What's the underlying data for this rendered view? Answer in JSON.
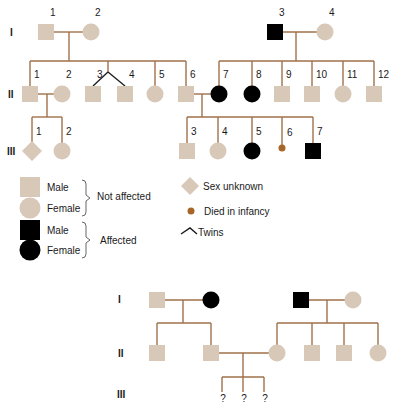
{
  "colors": {
    "line": "#a0714a",
    "unaffected": "#d8c8b8",
    "affected": "#000000",
    "infant_death": "#a8652a",
    "twins_line": "#1a1a1a",
    "text": "#1a1a1a"
  },
  "pedigree_top": {
    "generation_labels": [
      {
        "label": "I",
        "x": 10,
        "y": 36
      },
      {
        "label": "II",
        "x": 8,
        "y": 98
      },
      {
        "label": "III",
        "x": 7,
        "y": 155
      }
    ],
    "individuals": [
      {
        "id": "I-1",
        "num": "1",
        "shape": "square",
        "status": "unaffected",
        "x": 46,
        "y": 32
      },
      {
        "id": "I-2",
        "num": "2",
        "shape": "circle",
        "status": "unaffected",
        "x": 91,
        "y": 32
      },
      {
        "id": "I-3",
        "num": "3",
        "shape": "square",
        "status": "affected",
        "x": 275,
        "y": 32
      },
      {
        "id": "I-4",
        "num": "4",
        "shape": "circle",
        "status": "unaffected",
        "x": 325,
        "y": 32
      },
      {
        "id": "II-1",
        "num": "1",
        "shape": "square",
        "status": "unaffected",
        "x": 30,
        "y": 94
      },
      {
        "id": "II-2",
        "num": "2",
        "shape": "circle",
        "status": "unaffected",
        "x": 62,
        "y": 94
      },
      {
        "id": "II-3",
        "num": "3",
        "shape": "square",
        "status": "unaffected",
        "x": 93,
        "y": 94
      },
      {
        "id": "II-4",
        "num": "4",
        "shape": "square",
        "status": "unaffected",
        "x": 125,
        "y": 94
      },
      {
        "id": "II-5",
        "num": "5",
        "shape": "circle",
        "status": "unaffected",
        "x": 155,
        "y": 94
      },
      {
        "id": "II-6",
        "num": "6",
        "shape": "square",
        "status": "unaffected",
        "x": 186,
        "y": 94
      },
      {
        "id": "II-7",
        "num": "7",
        "shape": "circle",
        "status": "affected",
        "x": 219,
        "y": 94
      },
      {
        "id": "II-8",
        "num": "8",
        "shape": "circle",
        "status": "affected",
        "x": 252,
        "y": 94
      },
      {
        "id": "II-9",
        "num": "9",
        "shape": "square",
        "status": "unaffected",
        "x": 282,
        "y": 94
      },
      {
        "id": "II-10",
        "num": "10",
        "shape": "square",
        "status": "unaffected",
        "x": 312,
        "y": 94
      },
      {
        "id": "II-11",
        "num": "11",
        "shape": "circle",
        "status": "unaffected",
        "x": 343,
        "y": 94
      },
      {
        "id": "II-12",
        "num": "12",
        "shape": "square",
        "status": "unaffected",
        "x": 374,
        "y": 94
      },
      {
        "id": "III-1",
        "num": "1",
        "shape": "diamond",
        "status": "unaffected",
        "x": 32,
        "y": 151
      },
      {
        "id": "III-2",
        "num": "2",
        "shape": "circle",
        "status": "unaffected",
        "x": 62,
        "y": 151
      },
      {
        "id": "III-3",
        "num": "3",
        "shape": "square",
        "status": "unaffected",
        "x": 187,
        "y": 151
      },
      {
        "id": "III-4",
        "num": "4",
        "shape": "circle",
        "status": "unaffected",
        "x": 218,
        "y": 151
      },
      {
        "id": "III-5",
        "num": "5",
        "shape": "circle",
        "status": "affected",
        "x": 252,
        "y": 151
      },
      {
        "id": "III-6",
        "num": "6",
        "shape": "dot",
        "status": "died_in_infancy",
        "x": 282,
        "y": 148
      },
      {
        "id": "III-7",
        "num": "7",
        "shape": "square",
        "status": "affected",
        "x": 313,
        "y": 151
      }
    ],
    "lines": [
      [
        54,
        32,
        83,
        32
      ],
      [
        69,
        32,
        69,
        61
      ],
      [
        30,
        61,
        186,
        61
      ],
      [
        30,
        61,
        30,
        86
      ],
      [
        108,
        61,
        108,
        72
      ],
      [
        155,
        61,
        155,
        86
      ],
      [
        186,
        61,
        186,
        86
      ],
      [
        283,
        32,
        317,
        32
      ],
      [
        296,
        32,
        296,
        61
      ],
      [
        219,
        61,
        374,
        61
      ],
      [
        219,
        61,
        219,
        86
      ],
      [
        252,
        61,
        252,
        86
      ],
      [
        282,
        61,
        282,
        86
      ],
      [
        312,
        61,
        312,
        86
      ],
      [
        343,
        61,
        343,
        86
      ],
      [
        374,
        61,
        374,
        86
      ],
      [
        38,
        94,
        54,
        94
      ],
      [
        47,
        94,
        47,
        117
      ],
      [
        32,
        117,
        62,
        117
      ],
      [
        32,
        117,
        32,
        143
      ],
      [
        62,
        117,
        62,
        143
      ],
      [
        194,
        94,
        211,
        94
      ],
      [
        202,
        94,
        202,
        117
      ],
      [
        187,
        117,
        313,
        117
      ],
      [
        187,
        117,
        187,
        143
      ],
      [
        218,
        117,
        218,
        143
      ],
      [
        252,
        117,
        252,
        143
      ],
      [
        282,
        117,
        282,
        145
      ],
      [
        313,
        117,
        313,
        143
      ]
    ],
    "twin_lines": [
      [
        108,
        72,
        93,
        86
      ],
      [
        108,
        72,
        125,
        86
      ]
    ]
  },
  "legend": {
    "items": [
      {
        "shape": "square",
        "status": "unaffected",
        "label": "Male",
        "x": 30,
        "y": 187
      },
      {
        "shape": "circle",
        "status": "unaffected",
        "label": "Female",
        "x": 30,
        "y": 208
      },
      {
        "shape": "square",
        "status": "affected",
        "label": "Male",
        "x": 30,
        "y": 230
      },
      {
        "shape": "circle",
        "status": "affected",
        "label": "Female",
        "x": 30,
        "y": 250
      }
    ],
    "groups": [
      {
        "label": "Not affected",
        "x": 97,
        "y": 200,
        "brace_top": 180,
        "brace_bottom": 216
      },
      {
        "label": "Affected",
        "x": 100,
        "y": 244,
        "brace_top": 222,
        "brace_bottom": 258
      }
    ],
    "right_items": [
      {
        "shape": "diamond",
        "label": "Sex unknown",
        "x": 190,
        "y": 186
      },
      {
        "shape": "dot",
        "label": "Died in infancy",
        "x": 191,
        "y": 211
      },
      {
        "shape": "twins",
        "label": "Twins",
        "x": 187,
        "y": 232
      }
    ]
  },
  "pedigree_bottom": {
    "generation_labels": [
      {
        "label": "I",
        "x": 118,
        "y": 303
      },
      {
        "label": "II",
        "x": 118,
        "y": 357
      },
      {
        "label": "III",
        "x": 117,
        "y": 398
      }
    ],
    "individuals": [
      {
        "id": "b-I-1",
        "shape": "square",
        "status": "unaffected",
        "x": 157,
        "y": 300
      },
      {
        "id": "b-I-2",
        "shape": "circle",
        "status": "affected",
        "x": 211,
        "y": 300
      },
      {
        "id": "b-I-3",
        "shape": "square",
        "status": "affected",
        "x": 301,
        "y": 300
      },
      {
        "id": "b-I-4",
        "shape": "circle",
        "status": "unaffected",
        "x": 353,
        "y": 300
      },
      {
        "id": "b-II-1",
        "shape": "square",
        "status": "unaffected",
        "x": 157,
        "y": 353
      },
      {
        "id": "b-II-2",
        "shape": "square",
        "status": "unaffected",
        "x": 211,
        "y": 353
      },
      {
        "id": "b-II-3",
        "shape": "circle",
        "status": "unaffected",
        "x": 277,
        "y": 353
      },
      {
        "id": "b-II-4",
        "shape": "square",
        "status": "unaffected",
        "x": 312,
        "y": 353
      },
      {
        "id": "b-II-5",
        "shape": "square",
        "status": "unaffected",
        "x": 344,
        "y": 353
      },
      {
        "id": "b-II-6",
        "shape": "circle",
        "status": "unaffected",
        "x": 378,
        "y": 353
      }
    ],
    "lines": [
      [
        165,
        300,
        203,
        300
      ],
      [
        183,
        300,
        183,
        323
      ],
      [
        157,
        323,
        211,
        323
      ],
      [
        157,
        323,
        157,
        345
      ],
      [
        211,
        323,
        211,
        345
      ],
      [
        309,
        300,
        345,
        300
      ],
      [
        327,
        300,
        327,
        323
      ],
      [
        277,
        323,
        378,
        323
      ],
      [
        277,
        323,
        277,
        345
      ],
      [
        312,
        323,
        312,
        345
      ],
      [
        344,
        323,
        344,
        345
      ],
      [
        378,
        323,
        378,
        345
      ],
      [
        219,
        353,
        269,
        353
      ],
      [
        243,
        353,
        243,
        377
      ],
      [
        222,
        377,
        264,
        377
      ],
      [
        222,
        377,
        222,
        392
      ],
      [
        243,
        377,
        243,
        392
      ],
      [
        264,
        377,
        264,
        392
      ]
    ],
    "unknown_children": [
      {
        "label": "?",
        "x": 223,
        "y": 402
      },
      {
        "label": "?",
        "x": 244,
        "y": 402
      },
      {
        "label": "?",
        "x": 265,
        "y": 402
      }
    ]
  }
}
